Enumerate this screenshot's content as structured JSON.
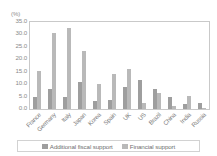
{
  "chart_data": {
    "type": "bar",
    "title": "",
    "xlabel": "",
    "ylabel": "",
    "unit_label": "(%)",
    "ylim": [
      0.0,
      35.0
    ],
    "ytick_labels": [
      "35.0",
      "30.0",
      "25.0",
      "20.0",
      "15.0",
      "10.0",
      "5.0",
      "0.0"
    ],
    "ytick_values": [
      35.0,
      30.0,
      25.0,
      20.0,
      15.0,
      10.0,
      5.0,
      0.0
    ],
    "grid": false,
    "legend_position": "bottom",
    "categories": [
      "France",
      "Germany",
      "Italy",
      "Japan",
      "Korea",
      "Spain",
      "UK",
      "US",
      "Brazil",
      "China",
      "India",
      "Russia"
    ],
    "series": [
      {
        "name": "Additional fiscal support",
        "color": "#9e9e9e",
        "values": [
          5.0,
          8.0,
          4.7,
          11.0,
          3.2,
          3.5,
          8.8,
          11.8,
          8.0,
          4.7,
          2.2,
          2.4
        ]
      },
      {
        "name": "Financial support",
        "color": "#b9b9b9",
        "values": [
          15.2,
          30.5,
          32.5,
          23.5,
          10.0,
          14.0,
          16.2,
          2.6,
          6.3,
          1.3,
          5.2,
          0.5
        ]
      }
    ]
  },
  "legend": {
    "items": [
      {
        "label": "Additional fiscal support"
      },
      {
        "label": "Financial support"
      }
    ]
  }
}
